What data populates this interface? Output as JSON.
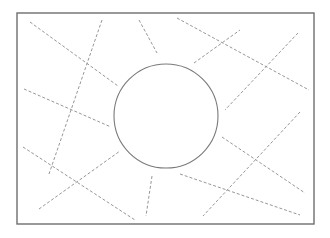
{
  "diagram": {
    "colors": {
      "background": "#ffffff",
      "frame": "#6e6e6e",
      "circle": "#7a7a7a",
      "dashed": "#8a8a8a"
    },
    "frame": {
      "x": 17,
      "y": 13,
      "width": 297,
      "height": 211
    },
    "circle": {
      "cx": 166,
      "cy": 116,
      "r": 52
    },
    "dashed_lines": [
      {
        "id": "a",
        "x1": 30,
        "y1": 22,
        "x2": 118,
        "y2": 86
      },
      {
        "id": "b",
        "x1": 102,
        "y1": 20,
        "x2": 49,
        "y2": 174
      },
      {
        "id": "c",
        "x1": 24,
        "y1": 89,
        "x2": 111,
        "y2": 127
      },
      {
        "id": "d",
        "x1": 23,
        "y1": 147,
        "x2": 135,
        "y2": 220
      },
      {
        "id": "e",
        "x1": 39,
        "y1": 209,
        "x2": 120,
        "y2": 151
      },
      {
        "id": "f",
        "x1": 152,
        "y1": 176,
        "x2": 146,
        "y2": 216
      },
      {
        "id": "g",
        "x1": 139,
        "y1": 20,
        "x2": 157,
        "y2": 53
      },
      {
        "id": "h",
        "x1": 177,
        "y1": 18,
        "x2": 309,
        "y2": 90
      },
      {
        "id": "i",
        "x1": 194,
        "y1": 63,
        "x2": 240,
        "y2": 30
      },
      {
        "id": "j",
        "x1": 298,
        "y1": 33,
        "x2": 225,
        "y2": 110
      },
      {
        "id": "k",
        "x1": 300,
        "y1": 112,
        "x2": 203,
        "y2": 216
      },
      {
        "id": "l",
        "x1": 222,
        "y1": 137,
        "x2": 305,
        "y2": 193
      },
      {
        "id": "m",
        "x1": 180,
        "y1": 174,
        "x2": 300,
        "y2": 215
      }
    ]
  }
}
